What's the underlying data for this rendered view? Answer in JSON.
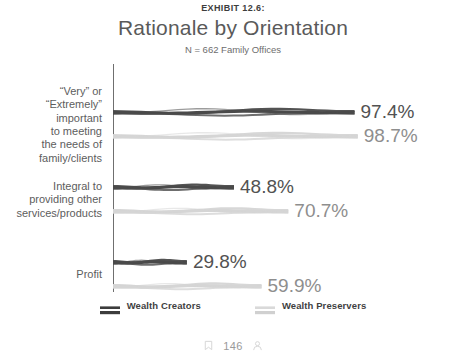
{
  "header": {
    "exhibit_label": "EXHIBIT 12.6:",
    "title": "Rationale by Orientation",
    "subtitle": "N = 662 Family Offices"
  },
  "legend": {
    "items": [
      {
        "label": "Wealth Creators",
        "color": "#4a4a4a",
        "swatch_icon": "ribbon-swatch-icon"
      },
      {
        "label": "Wealth Preservers",
        "color": "#d5d5d5",
        "swatch_icon": "ribbon-swatch-icon"
      }
    ]
  },
  "footer": {
    "left_icon": "bookmark-icon",
    "count": "146",
    "right_icon": "person-icon"
  },
  "chart_data": {
    "type": "bar",
    "title": "Rationale by Orientation",
    "subtitle": "N = 662 Family Offices",
    "xlabel": "",
    "ylabel": "",
    "xlim": [
      0,
      100
    ],
    "grid": false,
    "orientation": "horizontal",
    "legend_position": "bottom",
    "categories": [
      "“Very” or\n“Extremely”\nimportant\nto meeting\nthe needs of\nfamily/clients",
      "Integral to\nproviding other\nservices/products",
      "Profit"
    ],
    "series": [
      {
        "name": "Wealth Creators",
        "color": "#4a4a4a",
        "values": [
          97.4,
          48.8,
          29.8
        ],
        "labels": [
          "97.4%",
          "48.8%",
          "29.8%"
        ]
      },
      {
        "name": "Wealth Preservers",
        "color": "#d5d5d5",
        "values": [
          98.7,
          70.7,
          59.9
        ],
        "labels": [
          "98.7%",
          "70.7%",
          "59.9%"
        ]
      }
    ]
  }
}
